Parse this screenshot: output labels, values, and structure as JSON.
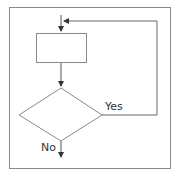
{
  "diagram": {
    "type": "flowchart",
    "nodes": [
      {
        "id": "process",
        "shape": "rectangle",
        "label": ""
      },
      {
        "id": "decision",
        "shape": "diamond",
        "label": ""
      }
    ],
    "edges": [
      {
        "from": "entry",
        "to": "process"
      },
      {
        "from": "process",
        "to": "decision"
      },
      {
        "from": "decision",
        "to": "process",
        "label": "Yes"
      },
      {
        "from": "decision",
        "to": "exit",
        "label": "No"
      }
    ],
    "labels": {
      "yes": "Yes",
      "no": "No"
    },
    "colors": {
      "frame": "#888888",
      "line": "#555555",
      "arrow": "#333333"
    }
  }
}
